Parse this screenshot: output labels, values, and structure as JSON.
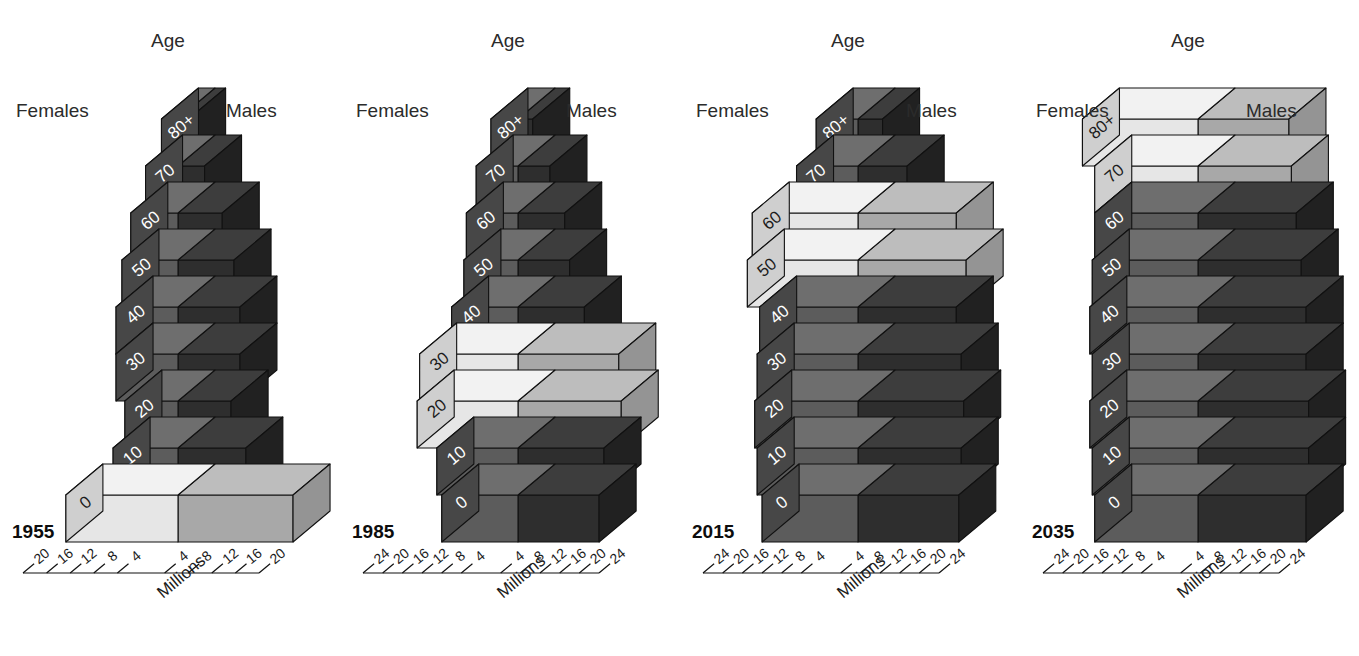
{
  "figure": {
    "type": "population-pyramid-3d",
    "axis_title": "Millions",
    "age_axis_label": "Age",
    "female_label": "Females",
    "male_label": "Males",
    "age_groups": [
      "0",
      "10",
      "20",
      "30",
      "40",
      "50",
      "60",
      "70",
      "80+"
    ],
    "colors": {
      "female_front": "#5c5c5c",
      "female_top": "#6e6e6e",
      "female_side": "#474747",
      "male_front": "#2e2e2e",
      "male_top": "#3d3d3d",
      "male_side": "#212121",
      "female_highlight_front": "#e6e6e6",
      "female_highlight_top": "#f2f2f2",
      "female_highlight_side": "#cfcfcf",
      "male_highlight_front": "#a8a8a8",
      "male_highlight_top": "#bdbdbd",
      "male_highlight_side": "#949494",
      "outline": "#111111",
      "text_on_dark": "#ffffff",
      "text_on_light": "#1c1c1c"
    }
  },
  "chart_data": {
    "type": "bar",
    "title": "",
    "xlabel": "Millions",
    "ylabel": "Age",
    "categories": [
      "0",
      "10",
      "20",
      "30",
      "40",
      "50",
      "60",
      "70",
      "80+"
    ],
    "panels": [
      {
        "year": "1955",
        "tick_labels_left": [
          "20",
          "16",
          "12",
          "8",
          "4"
        ],
        "tick_labels_right": [
          "4",
          "8",
          "12",
          "16",
          "20"
        ],
        "xlim": [
          0,
          20
        ],
        "highlighted": [
          "0"
        ],
        "series": [
          {
            "name": "Females",
            "values": [
              19.0,
              11.0,
              9.0,
              10.5,
              10.5,
              9.5,
              8.0,
              5.5,
              2.8
            ]
          },
          {
            "name": "Males",
            "values": [
              19.5,
              11.5,
              9.0,
              10.5,
              10.5,
              9.5,
              7.5,
              4.5,
              1.8
            ]
          }
        ]
      },
      {
        "year": "1985",
        "tick_labels_left": [
          "24",
          "20",
          "16",
          "12",
          "8",
          "4"
        ],
        "tick_labels_right": [
          "4",
          "8",
          "12",
          "16",
          "20",
          "24"
        ],
        "xlim": [
          0,
          24
        ],
        "highlighted": [
          "20",
          "30"
        ],
        "series": [
          {
            "name": "Females",
            "values": [
              15.5,
              16.5,
              20.5,
              20.0,
              13.5,
              11.0,
              10.5,
              8.5,
              5.5
            ]
          },
          {
            "name": "Males",
            "values": [
              16.5,
              17.5,
              21.0,
              20.5,
              13.5,
              10.5,
              9.5,
              6.5,
              3.0
            ]
          }
        ]
      },
      {
        "year": "2015",
        "tick_labels_left": [
          "24",
          "20",
          "16",
          "12",
          "8",
          "4"
        ],
        "tick_labels_right": [
          "4",
          "8",
          "12",
          "16",
          "20",
          "24"
        ],
        "xlim": [
          0,
          24
        ],
        "highlighted": [
          "50",
          "60"
        ],
        "series": [
          {
            "name": "Females",
            "values": [
              19.5,
              20.5,
              21.0,
              20.5,
              20.0,
              22.5,
              21.5,
              12.5,
              8.5
            ]
          },
          {
            "name": "Males",
            "values": [
              20.5,
              21.0,
              21.5,
              21.0,
              20.0,
              22.0,
              20.0,
              10.0,
              5.0
            ]
          }
        ]
      },
      {
        "year": "2035",
        "tick_labels_left": [
          "24",
          "20",
          "16",
          "12",
          "8",
          "4"
        ],
        "tick_labels_right": [
          "4",
          "8",
          "12",
          "16",
          "20",
          "24"
        ],
        "xlim": [
          0,
          24
        ],
        "highlighted": [
          "70",
          "80+"
        ],
        "series": [
          {
            "name": "Females",
            "values": [
              21.0,
              21.5,
              22.0,
              21.5,
              22.0,
              21.5,
              21.0,
              21.0,
              23.5
            ]
          },
          {
            "name": "Males",
            "values": [
              22.0,
              22.5,
              22.5,
              22.0,
              22.0,
              21.0,
              20.0,
              19.0,
              18.5
            ]
          }
        ]
      }
    ]
  }
}
